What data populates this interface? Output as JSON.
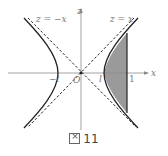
{
  "figure": {
    "caption_prefix": "図",
    "caption_number": "11",
    "axes": {
      "x_label": "x",
      "z_label": "z",
      "origin_label": "O"
    },
    "asymptotes": [
      {
        "label": "z = −x",
        "style": "dashed"
      },
      {
        "label": "z = x",
        "style": "dashed"
      }
    ],
    "tick_labels": {
      "left_vertex": "−l",
      "right_vertex": "l",
      "line_x": "1"
    },
    "curve": "hyperbola (two branches, opening left/right)",
    "shaded_region": "between right branch and vertical line x = 1",
    "colors": {
      "stroke": "#222222",
      "shade": "#999999",
      "axis": "#888888",
      "text": "#777777"
    }
  }
}
